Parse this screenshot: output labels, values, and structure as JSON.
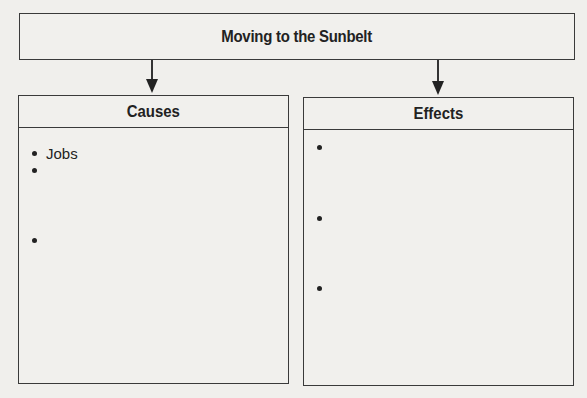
{
  "diagram": {
    "title": "Moving to the Sunbelt",
    "columns": [
      {
        "heading": "Causes",
        "items": [
          "Jobs",
          "",
          ""
        ]
      },
      {
        "heading": "Effects",
        "items": [
          "",
          "",
          ""
        ]
      }
    ],
    "arrows": [
      {
        "from": "Moving to the Sunbelt",
        "to": "Causes"
      },
      {
        "from": "Moving to the Sunbelt",
        "to": "Effects"
      }
    ]
  }
}
